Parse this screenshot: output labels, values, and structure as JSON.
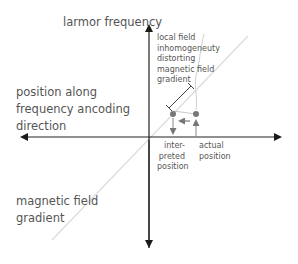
{
  "diagram": {
    "axes": {
      "y_positive_label": "larmor frequency",
      "x_label_lines": [
        "position along",
        "frequency ancoding",
        "direction"
      ]
    },
    "gradient_label_lines": [
      "magnetic field",
      "gradient"
    ],
    "inhomogeneity_label_lines": [
      "local field",
      "inhomogeneuty",
      "distorting",
      "magnetic field",
      "gradient"
    ],
    "interpreted_label_lines": [
      "inter-",
      "preted",
      "position"
    ],
    "actual_label_lines": [
      "actual",
      "position"
    ],
    "colors": {
      "axis": "#222222",
      "text": "#555555",
      "gradient_line": "#d8d8d8",
      "distorted_curve": "#cccccc",
      "points": "#777777",
      "arrows": "#777777",
      "measure_bar": "#444444"
    }
  }
}
